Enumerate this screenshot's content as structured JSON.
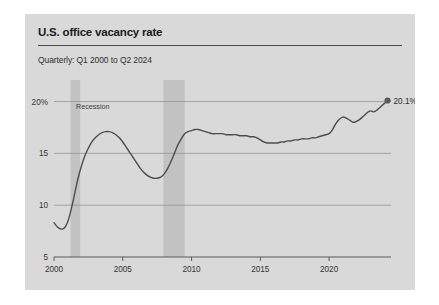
{
  "card": {
    "title": "U.S. office vacancy rate",
    "subtitle": "Quarterly: Q1 2000 to Q2 2024"
  },
  "chart_data": {
    "type": "line",
    "title": "U.S. office vacancy rate",
    "subtitle": "Quarterly: Q1 2000 to Q2 2024",
    "xlabel": "",
    "ylabel": "",
    "xlim": [
      2000,
      2024.5
    ],
    "ylim": [
      5,
      21.5
    ],
    "grid": true,
    "legend": "none",
    "y_ticks": [
      5,
      10,
      15,
      20
    ],
    "y_tick_labels": [
      "5",
      "10",
      "15",
      "20%"
    ],
    "x_ticks": [
      2000,
      2005,
      2010,
      2015,
      2020
    ],
    "x_tick_labels": [
      "2000",
      "2005",
      "2010",
      "2015",
      "2020"
    ],
    "series": [
      {
        "name": "U.S. office vacancy rate",
        "color": "#4d4d4d",
        "x": [
          2000.0,
          2000.25,
          2000.5,
          2000.75,
          2001.0,
          2001.25,
          2001.5,
          2001.75,
          2002.0,
          2002.25,
          2002.5,
          2002.75,
          2003.0,
          2003.25,
          2003.5,
          2003.75,
          2004.0,
          2004.25,
          2004.5,
          2004.75,
          2005.0,
          2005.25,
          2005.5,
          2005.75,
          2006.0,
          2006.25,
          2006.5,
          2006.75,
          2007.0,
          2007.25,
          2007.5,
          2007.75,
          2008.0,
          2008.25,
          2008.5,
          2008.75,
          2009.0,
          2009.25,
          2009.5,
          2009.75,
          2010.0,
          2010.25,
          2010.5,
          2010.75,
          2011.0,
          2011.25,
          2011.5,
          2011.75,
          2012.0,
          2012.25,
          2012.5,
          2012.75,
          2013.0,
          2013.25,
          2013.5,
          2013.75,
          2014.0,
          2014.25,
          2014.5,
          2014.75,
          2015.0,
          2015.25,
          2015.5,
          2015.75,
          2016.0,
          2016.25,
          2016.5,
          2016.75,
          2017.0,
          2017.25,
          2017.5,
          2017.75,
          2018.0,
          2018.25,
          2018.5,
          2018.75,
          2019.0,
          2019.25,
          2019.5,
          2019.75,
          2020.0,
          2020.25,
          2020.5,
          2020.75,
          2021.0,
          2021.25,
          2021.5,
          2021.75,
          2022.0,
          2022.25,
          2022.5,
          2022.75,
          2023.0,
          2023.25,
          2023.5,
          2023.75,
          2024.0,
          2024.25
        ],
        "y": [
          8.3,
          7.9,
          7.7,
          7.8,
          8.4,
          9.6,
          11.1,
          12.6,
          13.8,
          14.8,
          15.5,
          16.1,
          16.5,
          16.8,
          17.0,
          17.1,
          17.1,
          17.0,
          16.8,
          16.5,
          16.1,
          15.6,
          15.1,
          14.6,
          14.1,
          13.6,
          13.2,
          12.9,
          12.7,
          12.6,
          12.6,
          12.7,
          13.0,
          13.5,
          14.2,
          15.0,
          15.8,
          16.4,
          16.9,
          17.1,
          17.2,
          17.3,
          17.3,
          17.2,
          17.1,
          17.0,
          16.9,
          16.9,
          16.9,
          16.9,
          16.8,
          16.8,
          16.8,
          16.8,
          16.7,
          16.7,
          16.7,
          16.6,
          16.6,
          16.5,
          16.3,
          16.1,
          16.0,
          16.0,
          16.0,
          16.0,
          16.1,
          16.1,
          16.2,
          16.2,
          16.3,
          16.3,
          16.4,
          16.4,
          16.4,
          16.5,
          16.5,
          16.6,
          16.7,
          16.8,
          16.9,
          17.3,
          17.9,
          18.3,
          18.5,
          18.4,
          18.2,
          18.0,
          18.1,
          18.3,
          18.6,
          18.9,
          19.1,
          19.0,
          19.2,
          19.5,
          19.8,
          20.1
        ]
      }
    ],
    "annotations": [
      {
        "name": "recession-label",
        "text": "Recession",
        "x": 2001.6,
        "y": 19.3
      },
      {
        "name": "endpoint-value-label",
        "text": "20.1%",
        "x": 2024.25,
        "y": 20.1
      }
    ],
    "shaded_bands": [
      {
        "name": "recession-2001",
        "x0": 2001.2,
        "x1": 2001.9,
        "color": "#c2c2c2"
      },
      {
        "name": "recession-2008",
        "x0": 2007.95,
        "x1": 2009.5,
        "color": "#c2c2c2"
      }
    ]
  }
}
